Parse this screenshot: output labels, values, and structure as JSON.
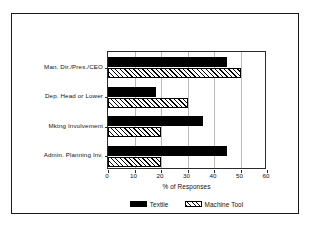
{
  "chart_data": {
    "type": "bar",
    "orientation": "horizontal",
    "title": "",
    "xlabel": "% of Responses",
    "ylabel": "",
    "xlim": [
      0,
      60
    ],
    "xticks": [
      0,
      10,
      20,
      30,
      40,
      50,
      60
    ],
    "xtick_labels": [
      "0",
      "10",
      "20",
      "30",
      "40",
      "50",
      "60"
    ],
    "grid": true,
    "grid_axis": "x",
    "legend_position": "bottom-center",
    "categories": [
      "Man. Dir./Pres./CEO",
      "Dep. Head or Lower",
      "Mktng Involvement",
      "Admin. Planning Inv."
    ],
    "series": [
      {
        "name": "Textile",
        "pattern": "solid-black",
        "color": "#000000",
        "values": [
          45,
          18,
          36,
          45
        ]
      },
      {
        "name": "Machine Tool",
        "pattern": "diagonal-hatch",
        "color": "#ffffff",
        "values": [
          50,
          30,
          20,
          20
        ]
      }
    ]
  },
  "legend": {
    "entries": [
      {
        "label": "Textile",
        "swatch": "solid-black-swatch"
      },
      {
        "label": "Machine Tool",
        "swatch": "hatched-swatch"
      }
    ]
  }
}
